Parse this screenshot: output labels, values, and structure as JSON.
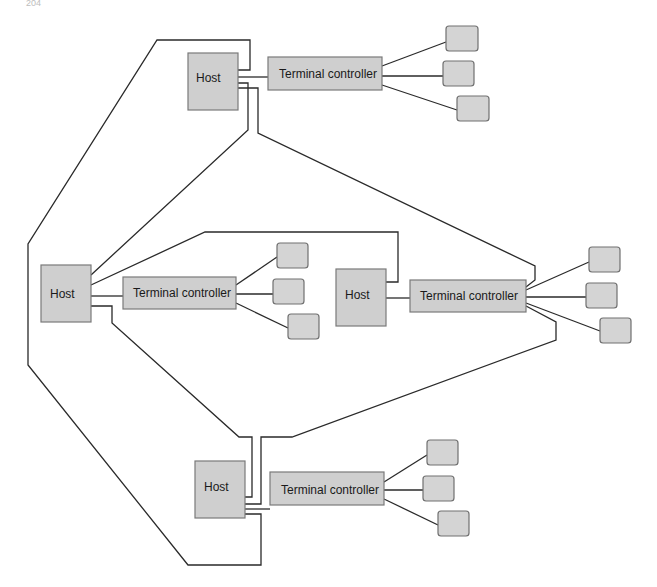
{
  "page": {
    "number": "204"
  },
  "labels": {
    "host": "Host",
    "terminal_controller": "Terminal controller"
  },
  "colors": {
    "box_fill": "#cfcfcf",
    "box_stroke": "#7a7a7a",
    "wire": "#2a2a2a",
    "background": "#ffffff"
  },
  "nodes": [
    {
      "id": "host-top",
      "type": "host",
      "label": "Host"
    },
    {
      "id": "tc-top",
      "type": "terminal_controller",
      "label": "Terminal controller",
      "terminals": 3
    },
    {
      "id": "host-left",
      "type": "host",
      "label": "Host"
    },
    {
      "id": "tc-left",
      "type": "terminal_controller",
      "label": "Terminal controller",
      "terminals": 3
    },
    {
      "id": "host-right",
      "type": "host",
      "label": "Host"
    },
    {
      "id": "tc-right",
      "type": "terminal_controller",
      "label": "Terminal controller",
      "terminals": 3
    },
    {
      "id": "host-bottom",
      "type": "host",
      "label": "Host"
    },
    {
      "id": "tc-bottom",
      "type": "terminal_controller",
      "label": "Terminal controller",
      "terminals": 3
    }
  ],
  "links": [
    {
      "from": "host-top",
      "to": "tc-top"
    },
    {
      "from": "host-left",
      "to": "tc-left"
    },
    {
      "from": "host-right",
      "to": "tc-right"
    },
    {
      "from": "host-bottom",
      "to": "tc-bottom"
    },
    {
      "from": "host-top",
      "to": "host-left"
    },
    {
      "from": "host-top",
      "to": "host-bottom"
    },
    {
      "from": "host-top",
      "to": "tc-right"
    },
    {
      "from": "host-left",
      "to": "host-right"
    },
    {
      "from": "host-left",
      "to": "host-bottom"
    },
    {
      "from": "host-bottom",
      "to": "tc-right"
    }
  ]
}
